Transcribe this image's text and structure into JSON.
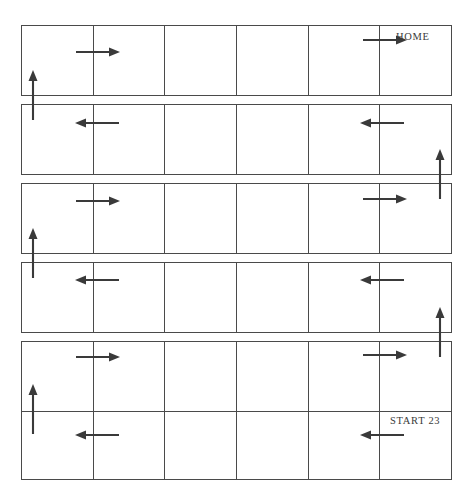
{
  "diagram": {
    "grid": {
      "rows": 6,
      "columns": 6,
      "left": 21,
      "width": 431,
      "row_height": 71,
      "row_gap": 8,
      "first_row_top": 25,
      "border_color": "#4a4a4a",
      "background": "#ffffff"
    },
    "labels": [
      {
        "id": "home-label",
        "text": "HOME",
        "x": 396,
        "y": 31
      },
      {
        "id": "start-label",
        "text": "START  23",
        "x": 390,
        "y": 415
      }
    ],
    "arrow_color": "#3a3a3a",
    "arrows": [
      {
        "id": "row1-arrow-left",
        "dir": "right",
        "x": 76,
        "y": 46,
        "length": 40
      },
      {
        "id": "row1-arrow-right",
        "dir": "right",
        "x": 363,
        "y": 40,
        "length": 40
      },
      {
        "id": "row1-riser-left",
        "dir": "up",
        "x": 33,
        "y": 74,
        "length": 44
      },
      {
        "id": "row2-arrow-left",
        "dir": "left",
        "x": 75,
        "y": 123,
        "length": 40
      },
      {
        "id": "row2-arrow-right",
        "dir": "left",
        "x": 360,
        "y": 123,
        "length": 40
      },
      {
        "id": "row2-riser-right",
        "dir": "up",
        "x": 440,
        "y": 153,
        "length": 44
      },
      {
        "id": "row3-arrow-left",
        "dir": "right",
        "x": 76,
        "y": 201,
        "length": 40
      },
      {
        "id": "row3-arrow-right",
        "dir": "right",
        "x": 363,
        "y": 199,
        "length": 40
      },
      {
        "id": "row3-riser-left",
        "dir": "up",
        "x": 33,
        "y": 232,
        "length": 44
      },
      {
        "id": "row4-arrow-left",
        "dir": "left",
        "x": 75,
        "y": 280,
        "length": 40
      },
      {
        "id": "row4-arrow-right",
        "dir": "left",
        "x": 360,
        "y": 280,
        "length": 40
      },
      {
        "id": "row4-riser-right",
        "dir": "up",
        "x": 440,
        "y": 311,
        "length": 44
      },
      {
        "id": "row5-arrow-left",
        "dir": "right",
        "x": 76,
        "y": 357,
        "length": 40
      },
      {
        "id": "row5-arrow-right",
        "dir": "right",
        "x": 363,
        "y": 355,
        "length": 40
      },
      {
        "id": "row5-riser-left",
        "dir": "up",
        "x": 33,
        "y": 388,
        "length": 44
      },
      {
        "id": "row6-arrow-left",
        "dir": "left",
        "x": 75,
        "y": 435,
        "length": 40
      },
      {
        "id": "row6-arrow-right",
        "dir": "left",
        "x": 360,
        "y": 435,
        "length": 40
      }
    ],
    "rows": [
      {
        "id": "row-1",
        "top": 25,
        "cells": [
          "",
          "",
          "",
          "",
          "",
          ""
        ]
      },
      {
        "id": "row-2",
        "top": 104,
        "cells": [
          "",
          "",
          "",
          "",
          "",
          ""
        ]
      },
      {
        "id": "row-3",
        "top": 183,
        "cells": [
          "",
          "",
          "",
          "",
          "",
          ""
        ]
      },
      {
        "id": "row-4",
        "top": 262,
        "cells": [
          "",
          "",
          "",
          "",
          "",
          ""
        ]
      },
      {
        "id": "row-5",
        "top": 341,
        "cells": [
          "",
          "",
          "",
          "",
          "",
          ""
        ]
      },
      {
        "id": "row-6",
        "top": 411,
        "cells": [
          "",
          "",
          "",
          "",
          "",
          ""
        ]
      }
    ]
  }
}
